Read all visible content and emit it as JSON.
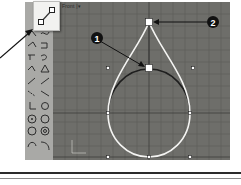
{
  "viewport": {
    "label": "Front |▾",
    "background": "#6e6e6a",
    "grid_color": "#5e5e5a",
    "axes": {
      "x_label": "x",
      "y_label": "y"
    }
  },
  "palette": {
    "tools": [
      {
        "icon": "polyline-icon"
      },
      {
        "icon": "curve-interpolate-icon"
      },
      {
        "icon": "curve-control-points-icon"
      },
      {
        "icon": "curve-handle-icon"
      },
      {
        "icon": "line-segments-icon"
      },
      {
        "icon": "arc-icon"
      },
      {
        "icon": "freeform-curve-icon"
      },
      {
        "icon": "conic-icon"
      },
      {
        "icon": "line-icon"
      },
      {
        "icon": "line-angle-icon"
      },
      {
        "icon": "polyline-dash-icon"
      },
      {
        "icon": "line-tangent-icon"
      },
      {
        "icon": "line-perpendicular-icon"
      },
      {
        "icon": "circle-arc-icon"
      },
      {
        "icon": "circle-center-icon"
      },
      {
        "icon": "circle-3pt-icon"
      },
      {
        "icon": "circle-tangent-icon"
      },
      {
        "icon": "circle-diameter-icon"
      },
      {
        "icon": "arc-start-icon"
      },
      {
        "icon": "arc-end-icon"
      }
    ],
    "highlighted_tool": {
      "icon": "line-control-point-icon"
    }
  },
  "callouts": [
    {
      "number": "1",
      "target": "control-point"
    },
    {
      "number": "2",
      "target": "top-point"
    }
  ],
  "figure": {
    "curve_color": "#f4f4f2",
    "arc_color": "#1e1e1e",
    "point_fill": "#ffffff"
  }
}
